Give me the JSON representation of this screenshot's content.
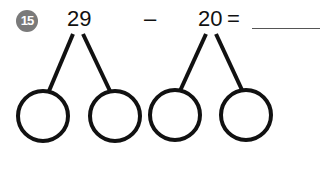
{
  "problem": {
    "number": "15",
    "minuend": "29",
    "operator": "–",
    "subtrahend": "20",
    "equals": "=",
    "answer": ""
  },
  "bonds": [
    {
      "parent": "29",
      "parts": [
        "",
        ""
      ]
    },
    {
      "parent": "20",
      "parts": [
        "",
        ""
      ]
    }
  ],
  "colors": {
    "badge": "#7a7a7a",
    "ink": "#111111"
  }
}
